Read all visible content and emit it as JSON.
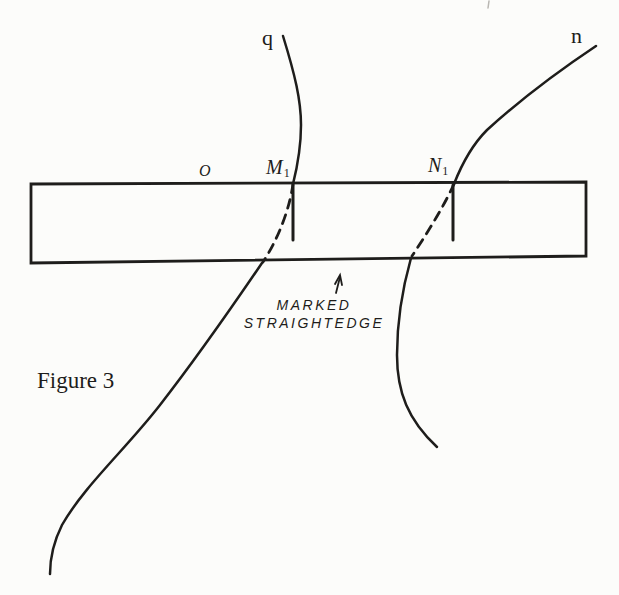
{
  "figure": {
    "caption": "Figure 3",
    "curve_labels": {
      "q": "q",
      "n": "n"
    },
    "points": {
      "o": "O",
      "m1": {
        "base": "M",
        "sub": "1"
      },
      "n1": {
        "base": "N",
        "sub": "1"
      }
    },
    "annotation": {
      "line1": "MARKED",
      "line2": "STRAIGHTEDGE"
    },
    "colors": {
      "ink": "#1e1d1b",
      "paper": "#fcfcfa"
    }
  }
}
